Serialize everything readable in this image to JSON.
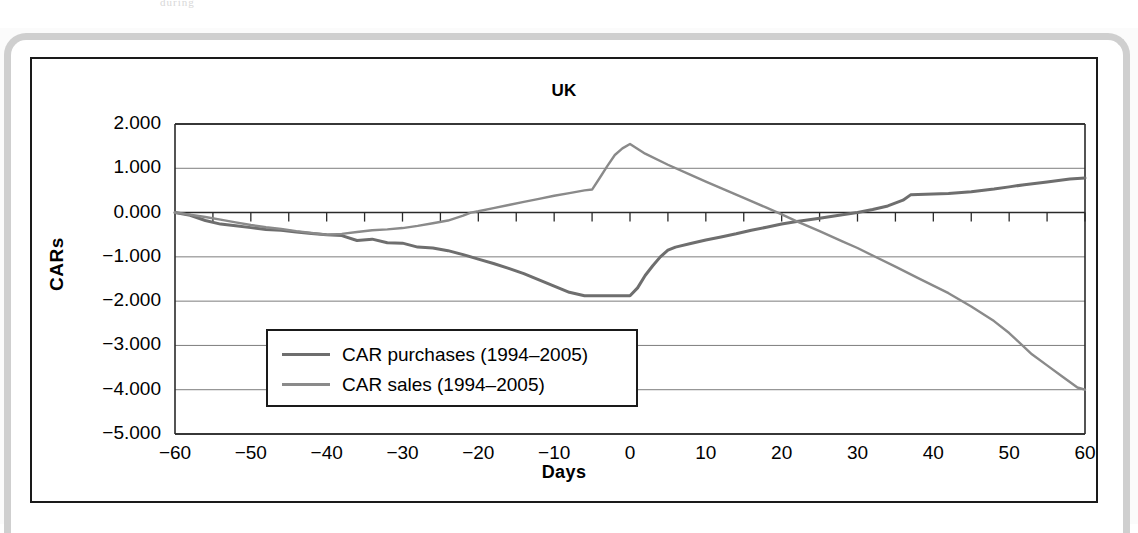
{
  "page": {
    "scan_top_text": "during"
  },
  "figure": {
    "title": "UK",
    "y_axis_title": "CARs",
    "x_axis_title": "Days"
  },
  "legend": {
    "items": [
      {
        "label": "CAR purchases (1994–2005)",
        "color": "#6e6e6e"
      },
      {
        "label": "CAR sales (1994–2005)",
        "color": "#8a8a8a"
      }
    ]
  },
  "chart_data": {
    "type": "line",
    "title": "UK",
    "xlabel": "Days",
    "ylabel": "CARs",
    "xlim": [
      -60,
      60
    ],
    "ylim": [
      -5.0,
      2.0
    ],
    "xticks": [
      -60,
      -50,
      -40,
      -30,
      -20,
      -10,
      0,
      10,
      20,
      30,
      40,
      50,
      60
    ],
    "xtick_labels": [
      "−60",
      "−50",
      "−40",
      "−30",
      "−20",
      "−10",
      "0",
      "10",
      "20",
      "30",
      "40",
      "50",
      "60"
    ],
    "yticks": [
      2.0,
      1.0,
      0.0,
      -1.0,
      -2.0,
      -3.0,
      -4.0,
      -5.0
    ],
    "ytick_labels": [
      "2.000",
      "1.000",
      "0.000",
      "−1.000",
      "−2.000",
      "−3.000",
      "−4.000",
      "−5.000"
    ],
    "minor_xtick_step": 5,
    "grid": true,
    "grid_axis": "y",
    "legend_position": "lower-left-inside",
    "series": [
      {
        "name": "CAR purchases (1994–2005)",
        "color": "#6e6e6e",
        "x": [
          -60,
          -58,
          -56,
          -54,
          -52,
          -50,
          -48,
          -46,
          -44,
          -42,
          -40,
          -38,
          -36,
          -34,
          -32,
          -30,
          -28,
          -26,
          -24,
          -22,
          -20,
          -18,
          -16,
          -14,
          -12,
          -10,
          -8,
          -6,
          -5,
          -4,
          -2,
          0,
          1,
          2,
          3,
          4,
          5,
          6,
          8,
          10,
          12,
          14,
          16,
          18,
          20,
          22,
          25,
          28,
          30,
          32,
          34,
          36,
          37,
          40,
          42,
          45,
          48,
          50,
          52,
          55,
          58,
          60
        ],
        "y": [
          0.0,
          -0.06,
          -0.18,
          -0.26,
          -0.3,
          -0.34,
          -0.38,
          -0.4,
          -0.44,
          -0.47,
          -0.5,
          -0.52,
          -0.63,
          -0.6,
          -0.68,
          -0.69,
          -0.78,
          -0.8,
          -0.86,
          -0.95,
          -1.05,
          -1.15,
          -1.26,
          -1.38,
          -1.52,
          -1.66,
          -1.8,
          -1.88,
          -1.88,
          -1.88,
          -1.88,
          -1.88,
          -1.7,
          -1.42,
          -1.2,
          -1.0,
          -0.85,
          -0.78,
          -0.7,
          -0.62,
          -0.55,
          -0.48,
          -0.4,
          -0.33,
          -0.26,
          -0.2,
          -0.13,
          -0.05,
          0.0,
          0.07,
          0.15,
          0.28,
          0.4,
          0.42,
          0.43,
          0.47,
          0.53,
          0.58,
          0.63,
          0.69,
          0.76,
          0.78
        ]
      },
      {
        "name": "CAR sales (1994–2005)",
        "color": "#8a8a8a",
        "x": [
          -60,
          -58,
          -56,
          -54,
          -52,
          -50,
          -48,
          -46,
          -44,
          -42,
          -40,
          -38,
          -36,
          -34,
          -32,
          -30,
          -28,
          -26,
          -24,
          -22,
          -21,
          -20,
          -18,
          -16,
          -14,
          -12,
          -10,
          -8,
          -6,
          -5,
          -4,
          -3,
          -2,
          -1,
          0,
          2,
          5,
          8,
          10,
          12,
          15,
          18,
          20,
          22,
          25,
          28,
          30,
          32,
          35,
          38,
          40,
          42,
          45,
          48,
          50,
          51,
          53,
          55,
          57,
          59,
          60
        ],
        "y": [
          0.0,
          -0.05,
          -0.1,
          -0.16,
          -0.22,
          -0.28,
          -0.33,
          -0.37,
          -0.42,
          -0.46,
          -0.5,
          -0.48,
          -0.44,
          -0.4,
          -0.38,
          -0.35,
          -0.3,
          -0.24,
          -0.18,
          -0.07,
          0.0,
          0.03,
          0.1,
          0.17,
          0.24,
          0.31,
          0.38,
          0.44,
          0.5,
          0.52,
          0.78,
          1.05,
          1.3,
          1.45,
          1.55,
          1.33,
          1.08,
          0.85,
          0.7,
          0.55,
          0.33,
          0.11,
          -0.04,
          -0.2,
          -0.42,
          -0.65,
          -0.8,
          -0.97,
          -1.22,
          -1.48,
          -1.65,
          -1.82,
          -2.12,
          -2.45,
          -2.72,
          -2.88,
          -3.2,
          -3.45,
          -3.7,
          -3.95,
          -4.0
        ]
      }
    ]
  }
}
